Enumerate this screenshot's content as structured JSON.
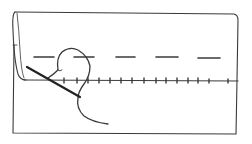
{
  "illustration": {
    "subject": "hemming stitch with needle and thread",
    "stroke_color": "#3a3a3a",
    "background": "#ffffff",
    "elements": {
      "fabric": "rectangle",
      "hem_fold": "folded edge line",
      "basting_dashes": 5,
      "stitch_ticks": 14,
      "needle": "needle-icon",
      "thread": "thread-loop"
    }
  }
}
